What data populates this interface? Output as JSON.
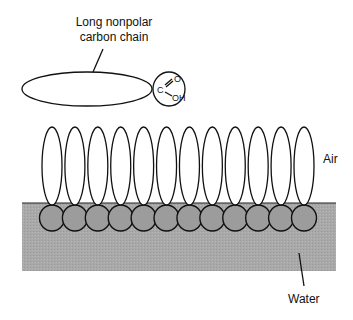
{
  "diagram": {
    "title_label": [
      "Long nonpolar",
      "carbon chain"
    ],
    "head_group": {
      "carbon": "C",
      "oxygen": "O",
      "hydroxyl": "OH"
    },
    "phases": {
      "air": "Air",
      "water": "Water"
    },
    "monolayer_molecule_count": 12,
    "colors": {
      "water": "#a8a8a8",
      "head_group": "#9c9c9c",
      "outline": "#111111",
      "background": "#ffffff"
    }
  }
}
